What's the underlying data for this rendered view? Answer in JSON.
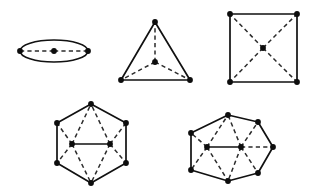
{
  "canvas": {
    "width": 316,
    "height": 196,
    "background": "#ffffff"
  },
  "style": {
    "solid_color": "#111111",
    "dashed_color": "#2b2b2b",
    "vertex_color": "#0d0d0d",
    "solid_width": 1.7,
    "dashed_width": 1.5,
    "dash_pattern": "4.2 3.2",
    "vertex_radius": 2.9
  },
  "figures": [
    {
      "name": "lens-digon-figure",
      "shape": "ellipse",
      "outline": {
        "type": "ellipse",
        "cx": 54,
        "cy": 51,
        "rx": 34,
        "ry": 11
      },
      "boundary_vertices": [
        {
          "id": "L",
          "x": 20,
          "y": 51
        },
        {
          "id": "R",
          "x": 88,
          "y": 51
        }
      ],
      "interior_vertices": [
        {
          "id": "C",
          "x": 54,
          "y": 51
        }
      ],
      "solid_edges": [],
      "dashed_edges": [
        {
          "from": "L",
          "to": "C"
        },
        {
          "from": "C",
          "to": "R"
        }
      ]
    },
    {
      "name": "triangle-figure",
      "shape": "triangle",
      "outline": {
        "type": "polygon",
        "points": "155,22 190,80 121,80"
      },
      "boundary_vertices": [
        {
          "id": "T",
          "x": 155,
          "y": 22
        },
        {
          "id": "BR",
          "x": 190,
          "y": 80
        },
        {
          "id": "BL",
          "x": 121,
          "y": 80
        }
      ],
      "interior_vertices": [
        {
          "id": "C",
          "x": 155,
          "y": 62
        }
      ],
      "solid_edges": [],
      "dashed_edges": [
        {
          "from": "C",
          "to": "T"
        },
        {
          "from": "C",
          "to": "BR"
        },
        {
          "from": "C",
          "to": "BL"
        }
      ]
    },
    {
      "name": "square-figure",
      "shape": "square",
      "outline": {
        "type": "polygon",
        "points": "230,14 297,14 297,82 230,82"
      },
      "boundary_vertices": [
        {
          "id": "TL",
          "x": 230,
          "y": 14
        },
        {
          "id": "TR",
          "x": 297,
          "y": 14
        },
        {
          "id": "BR",
          "x": 297,
          "y": 82
        },
        {
          "id": "BL",
          "x": 230,
          "y": 82
        }
      ],
      "interior_vertices": [
        {
          "id": "C",
          "x": 263,
          "y": 48
        }
      ],
      "solid_edges": [],
      "dashed_edges": [
        {
          "from": "C",
          "to": "TL"
        },
        {
          "from": "C",
          "to": "TR"
        },
        {
          "from": "C",
          "to": "BR"
        },
        {
          "from": "C",
          "to": "BL"
        }
      ]
    },
    {
      "name": "hexagon-figure",
      "shape": "hexagon",
      "outline": {
        "type": "polygon",
        "points": "91,104 126,123 126,163 91,183 57,163 57,123"
      },
      "boundary_vertices": [
        {
          "id": "T",
          "x": 91,
          "y": 104
        },
        {
          "id": "UR",
          "x": 126,
          "y": 123
        },
        {
          "id": "LR",
          "x": 126,
          "y": 163
        },
        {
          "id": "B",
          "x": 91,
          "y": 183
        },
        {
          "id": "LL",
          "x": 57,
          "y": 163
        },
        {
          "id": "UL",
          "x": 57,
          "y": 123
        }
      ],
      "interior_vertices": [
        {
          "id": "IL",
          "x": 72,
          "y": 144
        },
        {
          "id": "IR",
          "x": 110,
          "y": 144
        }
      ],
      "solid_edges": [
        {
          "from": "IL",
          "to": "IR"
        }
      ],
      "dashed_edges": [
        {
          "from": "IL",
          "to": "T"
        },
        {
          "from": "IL",
          "to": "UL"
        },
        {
          "from": "IL",
          "to": "LL"
        },
        {
          "from": "IL",
          "to": "B"
        },
        {
          "from": "IR",
          "to": "T"
        },
        {
          "from": "IR",
          "to": "UR"
        },
        {
          "from": "IR",
          "to": "LR"
        },
        {
          "from": "IR",
          "to": "B"
        }
      ]
    },
    {
      "name": "heptagon-figure",
      "shape": "heptagon",
      "outline": {
        "type": "polygon",
        "points": "228,115 258,122 273,147 258,173 228,181 191,170 191,133"
      },
      "boundary_vertices": [
        {
          "id": "T",
          "x": 228,
          "y": 115
        },
        {
          "id": "UR",
          "x": 258,
          "y": 122
        },
        {
          "id": "R",
          "x": 273,
          "y": 147
        },
        {
          "id": "LR",
          "x": 258,
          "y": 173
        },
        {
          "id": "B",
          "x": 228,
          "y": 181
        },
        {
          "id": "LL",
          "x": 191,
          "y": 170
        },
        {
          "id": "UL",
          "x": 191,
          "y": 133
        }
      ],
      "interior_vertices": [
        {
          "id": "IL",
          "x": 207,
          "y": 147
        },
        {
          "id": "IR",
          "x": 241,
          "y": 147
        }
      ],
      "solid_edges": [
        {
          "from": "IL",
          "to": "IR"
        }
      ],
      "dashed_edges": [
        {
          "from": "IL",
          "to": "T"
        },
        {
          "from": "IL",
          "to": "UL"
        },
        {
          "from": "IL",
          "to": "LL"
        },
        {
          "from": "IL",
          "to": "B"
        },
        {
          "from": "IR",
          "to": "T"
        },
        {
          "from": "IR",
          "to": "UR"
        },
        {
          "from": "IR",
          "to": "R"
        },
        {
          "from": "IR",
          "to": "LR"
        },
        {
          "from": "IR",
          "to": "B"
        }
      ]
    }
  ]
}
